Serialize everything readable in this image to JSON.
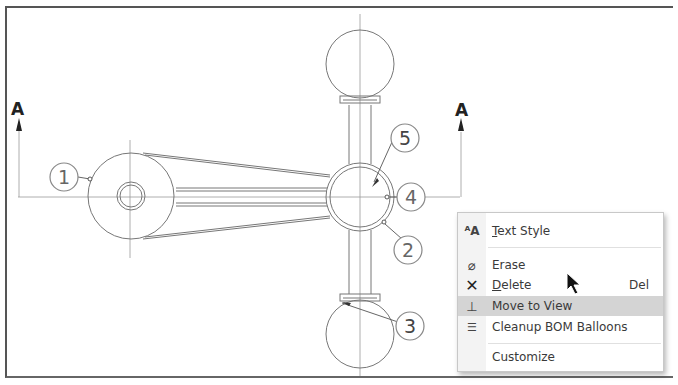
{
  "drawing": {
    "section_labels": [
      "A",
      "A"
    ],
    "balloons": [
      {
        "id": "balloon-1",
        "label": "1"
      },
      {
        "id": "balloon-2",
        "label": "2"
      },
      {
        "id": "balloon-3",
        "label": "3"
      },
      {
        "id": "balloon-4",
        "label": "4"
      },
      {
        "id": "balloon-5",
        "label": "5"
      }
    ],
    "line_color": "#888888",
    "balloon_color": "#666666"
  },
  "context_menu": {
    "items": [
      {
        "icon": "text-style-icon",
        "label": "Text Style",
        "mnemonic": "T",
        "rest": "ext Style"
      },
      {
        "icon": "erase-icon",
        "label": "Erase"
      },
      {
        "icon": "delete-icon",
        "label": "Delete",
        "mnemonic": "D",
        "rest": "elete",
        "shortcut": "Del"
      },
      {
        "icon": "move-to-view-icon",
        "label": "Move to View",
        "highlighted": true
      },
      {
        "icon": "cleanup-bom-balloons-icon",
        "label": "Cleanup BOM Balloons"
      },
      {
        "icon": "",
        "label": "Customize"
      }
    ],
    "highlight_color": "#d4d4d4"
  }
}
